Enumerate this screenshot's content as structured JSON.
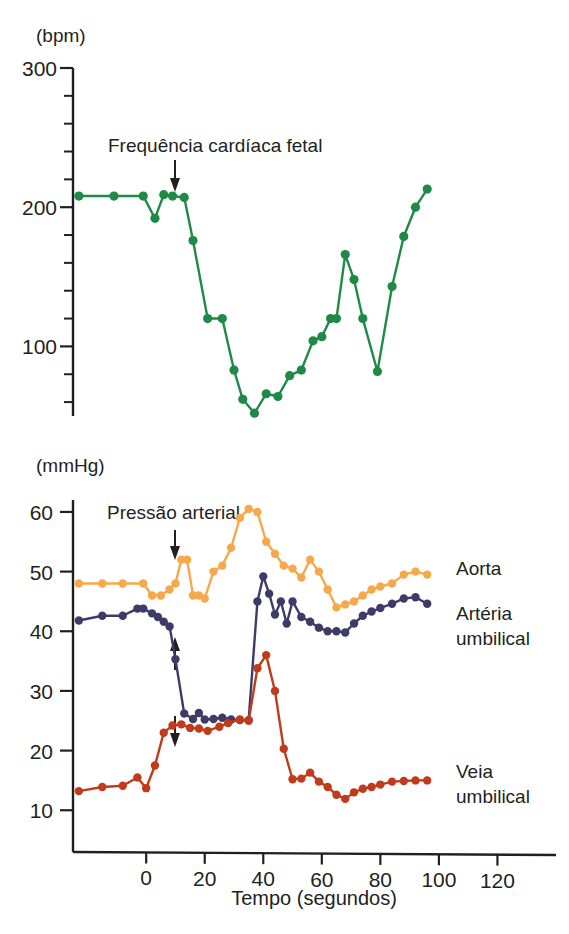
{
  "figure": {
    "background": "#ffffff",
    "text_color": "#231f20"
  },
  "colors": {
    "fetal_heart_rate": "#1f8a45",
    "aorta": "#f5a94a",
    "arteria_umbilical": "#3d3c68",
    "veia_umbilical": "#c13a1c",
    "axis": "#231f20"
  },
  "panels": {
    "top": {
      "unit_label": "(bpm)",
      "annotation": "Frequência cardíaca fetal",
      "annotation_arrow": "arrow-down",
      "y_ticks": [
        100,
        200,
        300
      ],
      "y_minor_step": 20,
      "ylim": [
        50,
        300
      ]
    },
    "bottom": {
      "unit_label": "(mmHg)",
      "annotation": "Pressão arterial",
      "annotation_arrows": [
        "arrow-down",
        "arrow-up",
        "arrow-down"
      ],
      "y_ticks": [
        10,
        20,
        30,
        40,
        50,
        60
      ],
      "ylim": [
        3,
        62
      ],
      "x_title": "Tempo (segundos)",
      "x_ticks": [
        0,
        20,
        40,
        60,
        80,
        100,
        120
      ],
      "xlim": [
        -25,
        140
      ],
      "series_labels": {
        "aorta": "Aorta",
        "arteria_umbilical_line1": "Artéria",
        "arteria_umbilical_line2": "umbilical",
        "veia_umbilical_line1": "Veia",
        "veia_umbilical_line2": "umbilical"
      }
    }
  },
  "chart_data": [
    {
      "type": "line",
      "id": "fetal-heart-rate",
      "title": "Frequência cardíaca fetal",
      "xlabel": "Tempo (segundos)",
      "ylabel": "(bpm)",
      "xlim": [
        -25,
        140
      ],
      "ylim": [
        50,
        300
      ],
      "grid": false,
      "legend": "inline-annotation",
      "markers": true,
      "series": [
        {
          "name": "Frequência cardíaca fetal",
          "color": "#1f8a45",
          "x": [
            -23,
            -11,
            -1,
            3,
            6,
            9,
            13,
            16,
            21,
            26,
            30,
            33,
            37,
            41,
            45,
            49,
            53,
            57,
            60,
            63,
            65,
            68,
            71,
            74,
            79,
            84,
            88,
            92,
            96
          ],
          "y": [
            208,
            208,
            208,
            192,
            209,
            208,
            207,
            176,
            120,
            120,
            83,
            62,
            52,
            66,
            64,
            79,
            83,
            104,
            107,
            120,
            120,
            166,
            148,
            120,
            82,
            143,
            179,
            200,
            213,
            196,
            204
          ]
        }
      ]
    },
    {
      "type": "line",
      "id": "blood-pressure",
      "title": "Pressão arterial",
      "xlabel": "Tempo (segundos)",
      "ylabel": "(mmHg)",
      "xlim": [
        -25,
        140
      ],
      "ylim": [
        3,
        62
      ],
      "grid": false,
      "legend": "right-of-plot",
      "markers": true,
      "series": [
        {
          "name": "Aorta",
          "color": "#f5a94a",
          "x": [
            -23,
            -15,
            -8,
            -1,
            2,
            5,
            8,
            10,
            12,
            14,
            16,
            18,
            20,
            23,
            26,
            29,
            32,
            35,
            38,
            41,
            44,
            47,
            50,
            53,
            56,
            59,
            62,
            65,
            68,
            71,
            74,
            77,
            80,
            84,
            88,
            92,
            96
          ],
          "y": [
            48,
            48,
            48,
            48,
            46,
            46,
            47,
            48,
            52,
            52,
            46,
            46,
            45.5,
            50,
            51,
            54,
            59,
            60.5,
            60,
            55,
            53,
            51,
            50.5,
            49,
            52,
            50,
            47,
            44,
            44.5,
            45,
            46,
            47,
            47.5,
            48,
            49.5,
            50,
            49.5
          ]
        },
        {
          "name": "Artéria umbilical",
          "color": "#3d3c68",
          "x": [
            -23,
            -15,
            -8,
            -3,
            -1,
            2,
            4,
            6,
            8,
            10,
            13,
            16,
            18,
            20,
            23,
            26,
            29,
            32,
            35,
            38,
            40,
            42,
            44,
            46,
            48,
            50,
            53,
            56,
            59,
            62,
            65,
            68,
            71,
            74,
            77,
            80,
            84,
            88,
            92,
            96
          ],
          "y": [
            41.8,
            42.6,
            42.6,
            43.8,
            43.8,
            43,
            42.4,
            41.6,
            40.8,
            35.3,
            26.2,
            25.3,
            26.3,
            25.2,
            25.3,
            25.5,
            25.2,
            25.1,
            25.1,
            45,
            49.2,
            46.3,
            42.8,
            45,
            41.3,
            45,
            42.4,
            41.6,
            40.6,
            40,
            40,
            39.8,
            41.3,
            42.6,
            43.3,
            43.9,
            44.6,
            45.5,
            45.7,
            44.6
          ]
        },
        {
          "name": "Veia umbilical",
          "color": "#c13a1c",
          "x": [
            -23,
            -15,
            -8,
            -3,
            0,
            3,
            6,
            9,
            12,
            15,
            18,
            21,
            25,
            28,
            32,
            35,
            38,
            41,
            44,
            47,
            50,
            53,
            56,
            59,
            62,
            65,
            68,
            71,
            74,
            77,
            80,
            84,
            88,
            92,
            96
          ],
          "y": [
            13.2,
            13.9,
            14.1,
            15.5,
            13.7,
            17.5,
            23,
            24.2,
            24.4,
            23.8,
            23.7,
            23.3,
            24,
            24.6,
            25.2,
            25,
            33.8,
            36,
            30,
            20.3,
            15.2,
            15.3,
            16.3,
            14.8,
            13.9,
            12.6,
            11.9,
            13,
            13.6,
            13.9,
            14.3,
            14.8,
            14.9,
            15,
            15
          ]
        }
      ]
    }
  ]
}
